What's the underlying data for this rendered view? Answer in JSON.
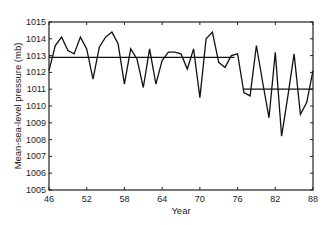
{
  "chart_data": {
    "type": "line",
    "title": "",
    "xlabel": "Year",
    "ylabel": "Mean-sea-level pressure (mb)",
    "xlim": [
      46,
      88
    ],
    "ylim": [
      1005,
      1015
    ],
    "grid": false,
    "legend": null,
    "x_ticks": [
      46,
      52,
      58,
      64,
      70,
      76,
      82,
      88
    ],
    "y_ticks": [
      1005,
      1006,
      1007,
      1008,
      1009,
      1010,
      1011,
      1012,
      1013,
      1014,
      1015
    ],
    "series": [
      {
        "name": "Annual mean-sea-level pressure",
        "x": [
          46,
          47,
          48,
          49,
          50,
          51,
          52,
          53,
          54,
          55,
          56,
          57,
          58,
          59,
          60,
          61,
          62,
          63,
          64,
          65,
          66,
          67,
          68,
          69,
          70,
          71,
          72,
          73,
          74,
          75,
          76,
          77,
          78,
          79,
          80,
          81,
          82,
          83,
          84,
          85,
          86,
          87,
          88
        ],
        "values": [
          1012.1,
          1013.6,
          1014.1,
          1013.3,
          1013.1,
          1014.1,
          1013.4,
          1011.6,
          1013.5,
          1014.1,
          1014.4,
          1013.7,
          1011.3,
          1013.4,
          1012.8,
          1011.1,
          1013.4,
          1011.3,
          1012.7,
          1013.2,
          1013.2,
          1013.1,
          1012.2,
          1013.4,
          1010.5,
          1014.0,
          1014.4,
          1012.6,
          1012.3,
          1013.0,
          1013.1,
          1010.8,
          1010.6,
          1013.6,
          1011.4,
          1009.3,
          1013.2,
          1008.2,
          1010.6,
          1013.1,
          1009.5,
          1010.2,
          1012.1
        ]
      }
    ],
    "reference_lines": [
      {
        "name": "Mean 1946-1976",
        "x_start": 46,
        "x_end": 75.5,
        "value": 1012.9
      },
      {
        "name": "Mean 1977-1988",
        "x_start": 77,
        "x_end": 88,
        "value": 1011.0
      }
    ]
  },
  "colors": {
    "line": "#111111",
    "axis": "#222222",
    "background": "#ffffff"
  }
}
